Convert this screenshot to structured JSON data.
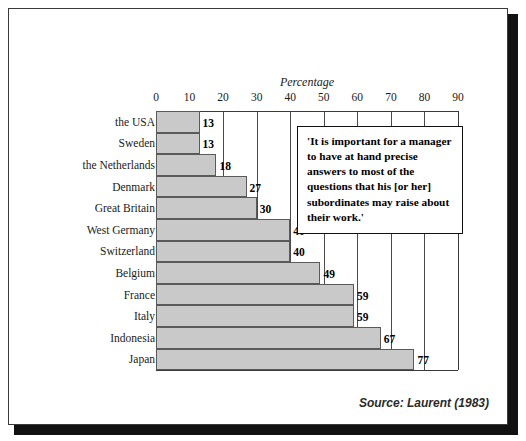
{
  "chart_data": {
    "type": "bar",
    "orientation": "horizontal",
    "title": "",
    "xlabel": "Percentage",
    "ylabel": "",
    "xlim": [
      0,
      90
    ],
    "xticks": [
      0,
      10,
      20,
      30,
      40,
      50,
      60,
      70,
      80,
      90
    ],
    "grid": true,
    "legend": false,
    "categories": [
      "the USA",
      "Sweden",
      "the Netherlands",
      "Denmark",
      "Great Britain",
      "West Germany",
      "Switzerland",
      "Belgium",
      "France",
      "Italy",
      "Indonesia",
      "Japan"
    ],
    "values": [
      13,
      13,
      18,
      27,
      30,
      40,
      40,
      49,
      59,
      59,
      67,
      77
    ],
    "value_labels": [
      "13",
      "13",
      "18",
      "27",
      "30",
      "40",
      "40",
      "49",
      "59",
      "59",
      "67",
      "77"
    ],
    "annotation": "'It is important for a manager to have at hand precise answers to most of the questions that his [or her] subordinates may raise about their work.'",
    "source": "Source: Laurent (1983)",
    "colors": {
      "bar_fill": "#c9c9c9",
      "bar_border": "#5a5a5a",
      "gridline": "#4a4a4a",
      "frame": "#3a3a3a",
      "text": "#1a1a1a",
      "shadow": "#111111",
      "background": "#ffffff"
    }
  },
  "axis": {
    "title": "Percentage",
    "tick_labels": [
      "0",
      "10",
      "20",
      "30",
      "40",
      "50",
      "60",
      "70",
      "80",
      "90"
    ]
  },
  "quote": {
    "text": "'It is important for a manager to have at hand precise answers to most of the questions that his [or her] subordinates may raise about their work.'"
  },
  "footer": {
    "source": "Source: Laurent (1983)"
  }
}
